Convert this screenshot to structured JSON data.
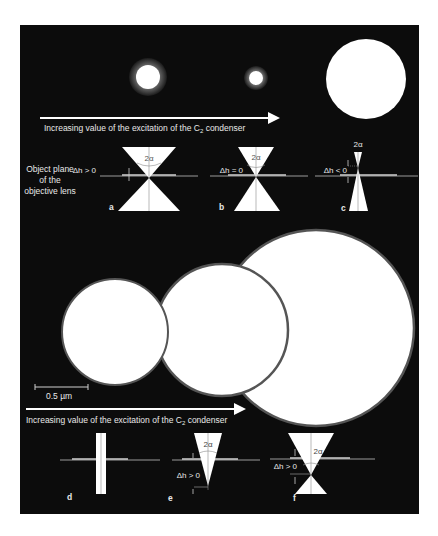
{
  "figure": {
    "background": "#0c0c0c",
    "beam_color": "#ffffff",
    "halo_color": "#5a5a5a",
    "line_color": "#bdbdbd",
    "top_arrow_label": "Increasing value of the excitation of the C",
    "top_arrow_sub": "2",
    "top_arrow_tail": " condenser",
    "bottom_arrow_label": "Increasing value of the excitation of the C",
    "bottom_arrow_sub": "2",
    "bottom_arrow_tail": " condenser",
    "object_plane_label": [
      "Object plane",
      "of the",
      "objective lens"
    ],
    "scale_bar_label": "0.5 µm",
    "angle_label": "2α",
    "panels": {
      "a": {
        "letter": "a",
        "dh": "Δh > 0"
      },
      "b": {
        "letter": "b",
        "dh": "Δh = 0"
      },
      "c": {
        "letter": "c",
        "dh": "Δh < 0"
      },
      "d": {
        "letter": "d"
      },
      "e": {
        "letter": "e",
        "dh": "Δh > 0"
      },
      "f": {
        "letter": "f",
        "dh": "Δh > 0"
      }
    }
  }
}
